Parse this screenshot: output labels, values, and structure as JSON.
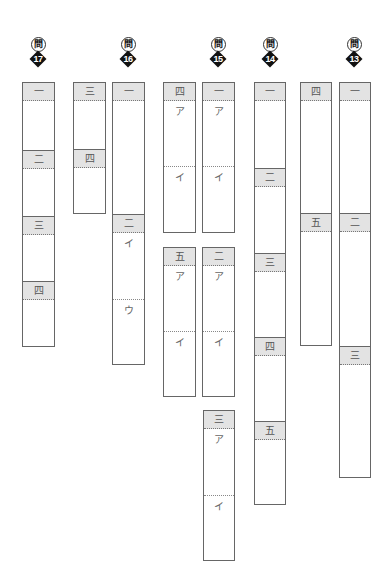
{
  "questions": [
    {
      "prefix": "問",
      "number": "17"
    },
    {
      "prefix": "問",
      "number": "16"
    },
    {
      "prefix": "問",
      "number": "15"
    },
    {
      "prefix": "問",
      "number": "14"
    },
    {
      "prefix": "問",
      "number": "13"
    }
  ],
  "columns": {
    "q17": {
      "sections": [
        {
          "label": "一"
        },
        {
          "label": "二"
        },
        {
          "label": "三"
        },
        {
          "label": "四"
        }
      ]
    },
    "q16a": {
      "sections": [
        {
          "label": "三"
        },
        {
          "label": "四"
        }
      ]
    },
    "q16b": {
      "sections": [
        {
          "label": "一"
        },
        {
          "label": "二",
          "subs": [
            "イ",
            "ウ"
          ]
        }
      ]
    },
    "q15a_top": {
      "sections": [
        {
          "label": "四",
          "subs": [
            "ア",
            "イ"
          ]
        }
      ]
    },
    "q15b_top": {
      "sections": [
        {
          "label": "一",
          "subs": [
            "ア",
            "イ"
          ]
        }
      ]
    },
    "q15a_mid": {
      "sections": [
        {
          "label": "五",
          "subs": [
            "ア",
            "イ"
          ]
        }
      ]
    },
    "q15b_mid": {
      "sections": [
        {
          "label": "二",
          "subs": [
            "ア",
            "イ"
          ]
        }
      ]
    },
    "q15b_bot": {
      "sections": [
        {
          "label": "三",
          "subs": [
            "ア",
            "イ"
          ]
        }
      ]
    },
    "q14": {
      "sections": [
        {
          "label": "一"
        },
        {
          "label": "二"
        },
        {
          "label": "三"
        },
        {
          "label": "四"
        },
        {
          "label": "五"
        }
      ]
    },
    "q13a": {
      "sections": [
        {
          "label": "四"
        },
        {
          "label": "五"
        }
      ]
    },
    "q13b": {
      "sections": [
        {
          "label": "一"
        },
        {
          "label": "二"
        },
        {
          "label": "三"
        }
      ]
    }
  }
}
